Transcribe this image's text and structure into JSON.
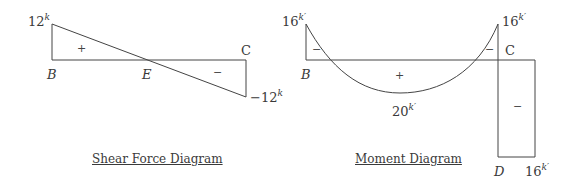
{
  "shear_diagram": {
    "caption": "Shear Force Diagram",
    "labels": {
      "max_value": "12",
      "max_unit": "k",
      "min_value": "−12",
      "min_unit": "k",
      "point_b": "B",
      "point_e": "E",
      "point_c": "C"
    },
    "signs": {
      "positive": "+",
      "negative": "−"
    },
    "values": {
      "B": 12,
      "E": 0,
      "C": -12
    }
  },
  "moment_diagram": {
    "caption": "Moment Diagram",
    "labels": {
      "left_value": "16",
      "left_unit": "k′",
      "right_value": "16",
      "right_unit": "k′",
      "mid_value": "20",
      "mid_unit": "k′",
      "column_value": "16",
      "column_unit": "k′",
      "point_b": "B",
      "point_c": "C",
      "point_d": "D"
    },
    "signs": {
      "left_negative": "−",
      "middle_positive": "+",
      "right_negative": "−",
      "column_negative": "−"
    },
    "values": {
      "B": -16,
      "midspan": 20,
      "C": -16,
      "column_CD": -16
    }
  },
  "colors": {
    "line": "#444444",
    "text": "#3a3a3a",
    "background": "#ffffff"
  }
}
